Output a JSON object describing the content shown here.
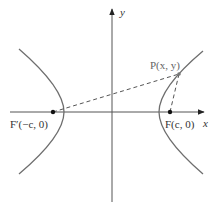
{
  "diagram": {
    "type": "hyperbola-foci",
    "axes": {
      "x_label": "x",
      "y_label": "y",
      "origin": [
        112,
        112
      ]
    },
    "points": {
      "focus_left": {
        "label": "F′(−c, 0)",
        "pos": [
          53,
          112
        ]
      },
      "focus_right": {
        "label": "F(c, 0)",
        "pos": [
          170,
          112
        ]
      },
      "point_p": {
        "label": "P(x, y)",
        "pos": [
          179,
          74
        ]
      }
    },
    "colors": {
      "curve": "#6e6e6e",
      "axis": "#555555",
      "dash": "#555555",
      "point": "#111111",
      "label": "#333333"
    }
  }
}
